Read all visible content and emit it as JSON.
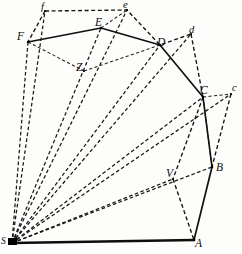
{
  "figure": {
    "background_color": "#fdfdfb",
    "ink_color": "#111111",
    "width": 242,
    "height": 254
  },
  "points": {
    "S": {
      "label": "S",
      "x": 12,
      "y": 243,
      "kind": "station"
    },
    "A": {
      "label": "A",
      "x": 194,
      "y": 240,
      "kind": "upper"
    },
    "B": {
      "label": "B",
      "x": 212,
      "y": 167,
      "kind": "upper"
    },
    "C": {
      "label": "C",
      "x": 203,
      "y": 97,
      "kind": "upper"
    },
    "D": {
      "label": "D",
      "x": 160,
      "y": 45,
      "kind": "upper"
    },
    "E": {
      "label": "E",
      "x": 101,
      "y": 28,
      "kind": "upper"
    },
    "F": {
      "label": "F",
      "x": 28,
      "y": 42,
      "kind": "upper"
    },
    "b": {
      "label": "b",
      "x": 212,
      "y": 167,
      "kind": "lower"
    },
    "c": {
      "label": "c",
      "x": 231,
      "y": 94,
      "kind": "lower"
    },
    "d": {
      "label": "d",
      "x": 191,
      "y": 34,
      "kind": "lower"
    },
    "e": {
      "label": "e",
      "x": 127,
      "y": 10,
      "kind": "lower"
    },
    "f": {
      "label": "f",
      "x": 45,
      "y": 11,
      "kind": "lower"
    },
    "V": {
      "label": "V",
      "x": 173,
      "y": 179,
      "kind": "upper"
    },
    "Z": {
      "label": "Z",
      "x": 84,
      "y": 71,
      "kind": "upper"
    }
  },
  "labels": [
    {
      "name": "label-f",
      "text": "f",
      "left": 41,
      "top": 2,
      "size": "lower"
    },
    {
      "name": "label-e",
      "text": "e",
      "left": 123,
      "top": 0,
      "size": "lower"
    },
    {
      "name": "label-E",
      "text": "E",
      "left": 95,
      "top": 17,
      "size": "upper"
    },
    {
      "name": "label-F",
      "text": "F",
      "left": 17,
      "top": 31,
      "size": "upper"
    },
    {
      "name": "label-d",
      "text": "d",
      "left": 189,
      "top": 25,
      "size": "lower"
    },
    {
      "name": "label-D",
      "text": "D",
      "left": 157,
      "top": 37,
      "size": "upper"
    },
    {
      "name": "label-Z",
      "text": "Z",
      "left": 76,
      "top": 62,
      "size": "upper"
    },
    {
      "name": "label-c",
      "text": "c",
      "left": 232,
      "top": 83,
      "size": "lower"
    },
    {
      "name": "label-C",
      "text": "C",
      "left": 200,
      "top": 85,
      "size": "upper"
    },
    {
      "name": "label-B",
      "text": "B",
      "left": 216,
      "top": 162,
      "size": "upper"
    },
    {
      "name": "label-V",
      "text": "V",
      "left": 166,
      "top": 168,
      "size": "upper"
    },
    {
      "name": "label-A",
      "text": "A",
      "left": 195,
      "top": 238,
      "size": "upper"
    },
    {
      "name": "label-S",
      "text": "S",
      "left": 1,
      "top": 237,
      "size": "station"
    }
  ],
  "edges": {
    "solid_polygon": {
      "name": "primary-traverse",
      "path": "M 28 42 L 101 28 L 160 45 L 203 97 L 212 167 L 194 240",
      "style": "solid"
    },
    "baseline": {
      "name": "baseline-S-A",
      "path": "M 12 243 L 194 240",
      "style": "solid-heavy"
    },
    "dashed_chain": {
      "name": "secondary-traverse",
      "path": "M 45 11 L 127 10 L 160 45 L 191 34",
      "style": "dashed"
    },
    "dashed_segments": [
      {
        "name": "edge-f-F",
        "path": "M 45 11 L 28 42"
      },
      {
        "name": "edge-F-Z",
        "path": "M 28 42 L 84 71"
      },
      {
        "name": "edge-Z-D",
        "path": "M 84 71 L 160 45"
      },
      {
        "name": "edge-E-e",
        "path": "M 101 28 L 127 10"
      },
      {
        "name": "edge-d-C",
        "path": "M 191 34 L 203 97"
      },
      {
        "name": "edge-C-c",
        "path": "M 203 97 L 231 94"
      },
      {
        "name": "edge-c-B",
        "path": "M 231 94 L 212 167"
      },
      {
        "name": "edge-C-V",
        "path": "M 203 97 L 173 179"
      },
      {
        "name": "edge-V-A",
        "path": "M 173 179 L 194 240"
      },
      {
        "name": "edge-C-B-dash",
        "path": "M 203 97 L 212 167"
      }
    ],
    "rays_from_station": [
      {
        "name": "ray-S-f",
        "path": "M 12 243 L 45 11"
      },
      {
        "name": "ray-S-F",
        "path": "M 12 243 L 28 42"
      },
      {
        "name": "ray-S-e",
        "path": "M 12 243 L 127 10"
      },
      {
        "name": "ray-S-E",
        "path": "M 12 243 L 101 28"
      },
      {
        "name": "ray-S-d",
        "path": "M 12 243 L 191 34"
      },
      {
        "name": "ray-S-D",
        "path": "M 12 243 L 160 45"
      },
      {
        "name": "ray-S-c",
        "path": "M 12 243 L 231 94"
      },
      {
        "name": "ray-S-C",
        "path": "M 12 243 L 203 97"
      },
      {
        "name": "ray-S-B",
        "path": "M 12 243 L 212 167"
      },
      {
        "name": "ray-S-V",
        "path": "M 12 243 L 173 179"
      }
    ]
  }
}
